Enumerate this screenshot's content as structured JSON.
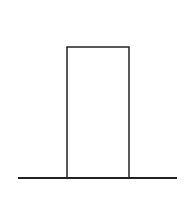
{
  "diagram": {
    "canvas": {
      "width": 192,
      "height": 202,
      "background": "#ffffff"
    },
    "stroke_color": "#222222",
    "ground_line": {
      "x1": 18,
      "y1": 178,
      "x2": 177,
      "y2": 178,
      "stroke_width": 2
    },
    "block": {
      "x": 67,
      "y": 47,
      "width": 62,
      "height": 131,
      "stroke_width": 1.5,
      "fill": "#ffffff"
    }
  }
}
